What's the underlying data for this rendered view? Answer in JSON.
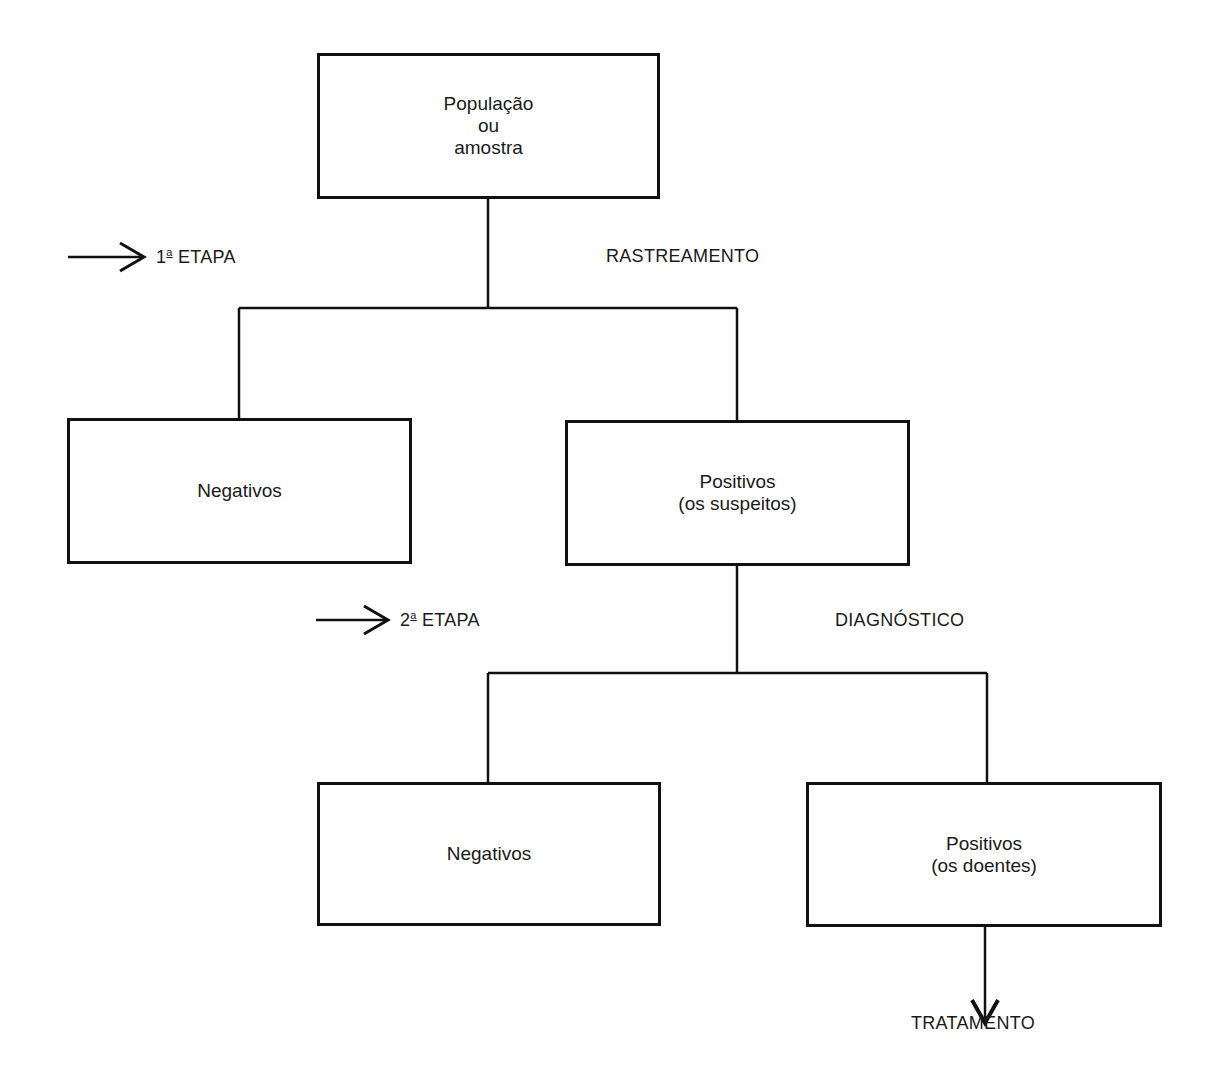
{
  "diagram": {
    "root": {
      "lines": [
        "População",
        "ou",
        "amostra"
      ]
    },
    "stage1": {
      "ordinal": "1",
      "suffix": "a",
      "label": "ETAPA",
      "process": "RASTREAMENTO"
    },
    "level1": {
      "negative": {
        "lines": [
          "Negativos"
        ]
      },
      "positive": {
        "lines": [
          "Positivos",
          "(os suspeitos)"
        ]
      }
    },
    "stage2": {
      "ordinal": "2",
      "suffix": "a",
      "label": "ETAPA",
      "process": "DIAGNÓSTICO"
    },
    "level2": {
      "negative": {
        "lines": [
          "Negativos"
        ]
      },
      "positive": {
        "lines": [
          "Positivos",
          "(os doentes)"
        ]
      }
    },
    "outcome": "TRATAMENTO"
  }
}
